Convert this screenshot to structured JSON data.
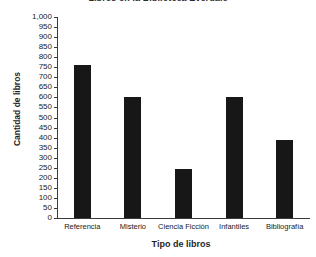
{
  "chart_data": {
    "type": "bar",
    "title": "Libros en la Biblioteca Everdale",
    "xlabel": "Tipo de libros",
    "ylabel": "Cantidad de libros",
    "categories": [
      "Referencia",
      "Misterio",
      "Ciencia Ficción",
      "Infantiles",
      "Bibliografía"
    ],
    "values": [
      760,
      600,
      245,
      600,
      390
    ],
    "ylim": [
      0,
      1000
    ],
    "ytick_step": 50,
    "ytick_labels": [
      "0",
      "50",
      "100",
      "150",
      "200",
      "250",
      "300",
      "350",
      "400",
      "450",
      "500",
      "550",
      "600",
      "650",
      "700",
      "750",
      "800",
      "850",
      "900",
      "950",
      "1,000"
    ],
    "ytick_values": [
      0,
      50,
      100,
      150,
      200,
      250,
      300,
      350,
      400,
      450,
      500,
      550,
      600,
      650,
      700,
      750,
      800,
      850,
      900,
      950,
      1000
    ],
    "grid": false,
    "legend": "none",
    "bar_color": "#171717",
    "axis_color": "#3a3a3a",
    "background_color": "#ffffff"
  }
}
